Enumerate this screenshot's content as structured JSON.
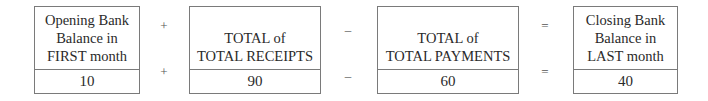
{
  "boxes": [
    {
      "label_lines": [
        "Opening Bank",
        "Balance in",
        "FIRST month"
      ],
      "value": "10"
    },
    {
      "label_lines": [
        "TOTAL of",
        "TOTAL RECEIPTS"
      ],
      "value": "90"
    },
    {
      "label_lines": [
        "TOTAL of",
        "TOTAL PAYMENTS"
      ],
      "value": "60"
    },
    {
      "label_lines": [
        "Closing Bank",
        "Balance in",
        "LAST month"
      ],
      "value": "40"
    }
  ],
  "operators": [
    "+",
    "–",
    "="
  ]
}
